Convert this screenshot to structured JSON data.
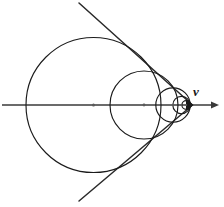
{
  "figure": {
    "background_color": "#ffffff",
    "stroke_color": "#1b1b1b",
    "axis_color": "#3a3a3a",
    "center_dot_color": "#5a5a5a",
    "width": 224,
    "height": 207
  },
  "axis": {
    "label": "v",
    "label_x": 193,
    "label_y": 85,
    "start_x": 2,
    "end_x": 219,
    "y": 105,
    "arrow_tip_x": 219,
    "arrow_half_height": 3.6,
    "arrow_length": 8
  },
  "apex": {
    "x": 192.5,
    "y": 105,
    "label": "vertex"
  },
  "angle_lines": [
    {
      "name": "upper-tangent-line",
      "x1": 79,
      "y1": 3,
      "x2": 192.5,
      "y2": 105
    },
    {
      "name": "lower-tangent-line",
      "x1": 79,
      "y1": 201,
      "x2": 192.5,
      "y2": 105
    }
  ],
  "circles": [
    {
      "name": "circle-1",
      "cx": 93.5,
      "cy": 105,
      "r": 67.5,
      "center_dot": true,
      "dot_r": 1.5
    },
    {
      "name": "circle-2",
      "cx": 144.0,
      "cy": 105,
      "r": 34.0,
      "center_dot": true,
      "dot_r": 1.4
    },
    {
      "name": "circle-3",
      "cx": 173.0,
      "cy": 105,
      "r": 17.2,
      "center_dot": true,
      "dot_r": 1.3
    },
    {
      "name": "circle-4",
      "cx": 181.5,
      "cy": 105,
      "r": 8.7,
      "center_dot": true,
      "dot_r": 1.1
    },
    {
      "name": "circle-5",
      "cx": 186.3,
      "cy": 105,
      "r": 4.4,
      "center_dot": true,
      "dot_r": 0.9
    },
    {
      "name": "circle-6",
      "cx": 189.0,
      "cy": 105,
      "r": 2.2,
      "center_dot": false,
      "dot_r": 0
    },
    {
      "name": "circle-7",
      "cx": 190.5,
      "cy": 105,
      "r": 1.1,
      "center_dot": false,
      "dot_r": 0
    },
    {
      "name": "circle-8",
      "cx": 191.4,
      "cy": 105,
      "r": 0.6,
      "center_dot": false,
      "dot_r": 0
    }
  ],
  "chart_data": {
    "type": "scatter",
    "xlabel": "v",
    "ylabel": "",
    "grid": false,
    "legend": "none",
    "xlim": [
      0,
      224
    ],
    "ylim": [
      0,
      207
    ],
    "annotations": [
      "v"
    ],
    "series": [
      {
        "name": "circle-centers",
        "x": [
          93.5,
          144.0,
          173.0,
          181.5,
          186.3,
          189.0,
          190.5,
          191.4
        ],
        "y": [
          105,
          105,
          105,
          105,
          105,
          105,
          105,
          105
        ],
        "radii": [
          67.5,
          34.0,
          17.2,
          8.7,
          4.4,
          2.2,
          1.1,
          0.6
        ]
      },
      {
        "name": "apex",
        "x": [
          192.5
        ],
        "y": [
          105
        ],
        "radii": [
          0
        ]
      }
    ]
  }
}
